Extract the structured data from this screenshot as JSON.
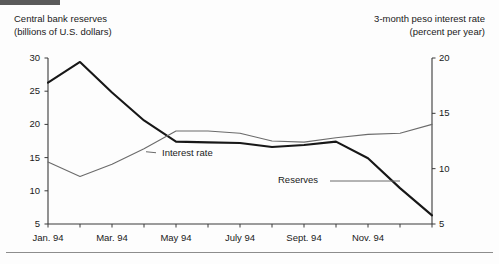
{
  "figure": {
    "background_color": "#fdfdfd",
    "top_bar_color": "#5a5a5a",
    "rule_color": "#8d8d8d"
  },
  "chart_data": {
    "type": "line",
    "title": "",
    "xlabel": "",
    "left_axis_title": "Central bank reserves\n(billions of U.S. dollars)",
    "right_axis_title": "3-month peso interest rate\n(percent per year)",
    "ylabel": "billions of U.S. dollars",
    "y2label": "percent per year",
    "ylim": [
      5,
      30
    ],
    "y2lim": [
      5,
      20
    ],
    "yticks": [
      5,
      10,
      15,
      20,
      25,
      30
    ],
    "y2ticks": [
      5,
      10,
      15,
      20
    ],
    "ytick_labels": [
      "5",
      "10",
      "15",
      "20",
      "25",
      "30"
    ],
    "y2tick_labels": [
      "5",
      "10",
      "15",
      "20"
    ],
    "grid": false,
    "legend_position": "inline-annotation",
    "x": [
      "Jan. 94",
      "Feb. 94",
      "Mar. 94",
      "Apr. 94",
      "May 94",
      "June 94",
      "July 94",
      "Aug. 94",
      "Sept. 94",
      "Oct. 94",
      "Nov. 94",
      "Dec. 94",
      "Jan. 95"
    ],
    "xtick_labels_shown": [
      "Jan. 94",
      "Mar. 94",
      "May 94",
      "July 94",
      "Sept. 94",
      "Nov. 94"
    ],
    "xtick_shown_indices": [
      0,
      2,
      4,
      6,
      8,
      10
    ],
    "series": [
      {
        "name": "Reserves",
        "axis": "left",
        "color": "#171717",
        "width": 2.1,
        "values": [
          26.3,
          29.4,
          24.8,
          20.6,
          17.4,
          17.3,
          17.2,
          16.6,
          16.9,
          17.4,
          14.9,
          10.4,
          6.3
        ]
      },
      {
        "name": "Interest rate",
        "axis": "right",
        "color": "#6b6b6b",
        "width": 1.1,
        "values": [
          10.6,
          9.3,
          10.4,
          11.8,
          13.4,
          13.4,
          13.2,
          12.5,
          12.4,
          12.8,
          13.1,
          13.2,
          14.0
        ]
      }
    ],
    "annotations": [
      {
        "text": "Interest rate",
        "series": "Interest rate"
      },
      {
        "text": "Reserves",
        "series": "Reserves"
      }
    ]
  }
}
